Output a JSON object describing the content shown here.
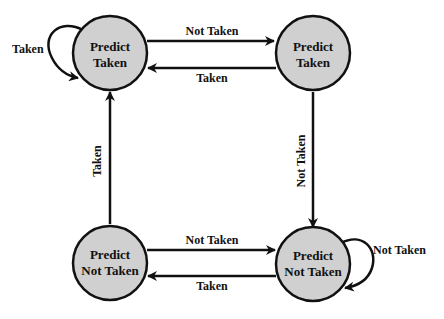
{
  "diagram": {
    "type": "state-machine",
    "colors": {
      "state_fill": "#d0d0d0",
      "stroke": "#111111",
      "background": "#ffffff"
    },
    "states": [
      {
        "id": "s0",
        "line1": "Predict",
        "line2": "Taken"
      },
      {
        "id": "s1",
        "line1": "Predict",
        "line2": "Taken"
      },
      {
        "id": "s2",
        "line1": "Predict",
        "line2": "Not Taken"
      },
      {
        "id": "s3",
        "line1": "Predict",
        "line2": "Not Taken"
      }
    ],
    "transitions": [
      {
        "from": "s0",
        "to": "s0",
        "label": "Taken"
      },
      {
        "from": "s0",
        "to": "s1",
        "label": "Not Taken"
      },
      {
        "from": "s1",
        "to": "s0",
        "label": "Taken"
      },
      {
        "from": "s1",
        "to": "s3",
        "label": "Not Taken"
      },
      {
        "from": "s2",
        "to": "s0",
        "label": "Taken"
      },
      {
        "from": "s2",
        "to": "s3",
        "label": "Not Taken"
      },
      {
        "from": "s3",
        "to": "s2",
        "label": "Taken"
      },
      {
        "from": "s3",
        "to": "s3",
        "label": "Not Taken"
      }
    ]
  }
}
